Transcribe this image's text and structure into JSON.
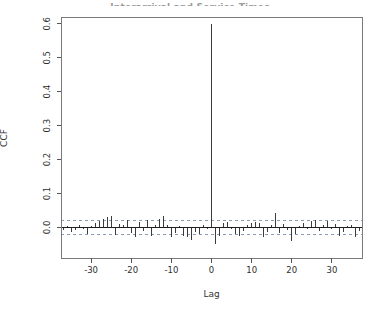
{
  "page": {
    "background": "#ffffff"
  },
  "chart": {
    "title": "Interarrival and Service Times",
    "xlabel": "Lag",
    "ylabel": "CCF"
  },
  "chart_data": {
    "type": "bar",
    "subtype": "ccf-stem-plot",
    "title": "Interarrival and Service Times",
    "xlabel": "Lag",
    "ylabel": "CCF",
    "x": [
      -37,
      -36,
      -35,
      -34,
      -33,
      -32,
      -31,
      -30,
      -29,
      -28,
      -27,
      -26,
      -25,
      -24,
      -23,
      -22,
      -21,
      -20,
      -19,
      -18,
      -17,
      -16,
      -15,
      -14,
      -13,
      -12,
      -11,
      -10,
      -9,
      -8,
      -7,
      -6,
      -5,
      -4,
      -3,
      -2,
      -1,
      0,
      1,
      2,
      3,
      4,
      5,
      6,
      7,
      8,
      9,
      10,
      11,
      12,
      13,
      14,
      15,
      16,
      17,
      18,
      19,
      20,
      21,
      22,
      23,
      24,
      25,
      26,
      27,
      28,
      29,
      30,
      31,
      32,
      33,
      34,
      35,
      36,
      37
    ],
    "values": [
      -0.008,
      0.005,
      -0.012,
      -0.008,
      0.006,
      -0.005,
      -0.018,
      0.004,
      0.012,
      0.018,
      0.026,
      0.03,
      0.033,
      -0.022,
      0.01,
      0.006,
      0.022,
      -0.015,
      -0.028,
      0.015,
      -0.01,
      0.023,
      -0.024,
      0.008,
      0.026,
      0.035,
      0.006,
      -0.028,
      -0.015,
      0.005,
      -0.024,
      -0.029,
      -0.036,
      -0.012,
      -0.018,
      0.008,
      -0.006,
      0.6,
      -0.05,
      -0.024,
      0.012,
      0.015,
      -0.006,
      -0.018,
      -0.025,
      -0.01,
      0.008,
      0.014,
      0.016,
      0.013,
      -0.027,
      -0.012,
      0.006,
      0.042,
      -0.015,
      0.01,
      -0.008,
      -0.04,
      -0.02,
      0.005,
      0.012,
      -0.006,
      0.018,
      0.023,
      -0.01,
      0.008,
      0.02,
      -0.005,
      0.01,
      -0.024,
      -0.012,
      0.004,
      0.008,
      -0.028,
      -0.01
    ],
    "conf_bounds": [
      -0.021,
      0.021
    ],
    "zero_line": true,
    "grid": false,
    "legend": null,
    "x_ticks": [
      -30,
      -20,
      -10,
      0,
      10,
      20,
      30
    ],
    "y_ticks": [
      0.0,
      0.1,
      0.2,
      0.3,
      0.4,
      0.5,
      0.6
    ],
    "xlim": [
      -37.5,
      37.5
    ],
    "ylim": [
      -0.09,
      0.62
    ],
    "colors": {
      "bar": "#3c3c3c",
      "axis_box": "#7a7a7a",
      "zero_line": "#1f1f1f",
      "conf_dash": "#8c9bb0",
      "tick": "#555555",
      "tick_label": "#2e2e2e"
    }
  }
}
